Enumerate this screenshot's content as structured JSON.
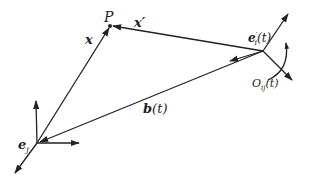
{
  "figure": {
    "type": "coordinate-frame-diagram",
    "background": "#ffffff",
    "stroke_color": "#222222"
  },
  "labels": {
    "point_p": "P",
    "vector_x": "x",
    "vector_x_prime": "x′",
    "frame_j": "e",
    "frame_j_sub": "j",
    "frame_i": "e",
    "frame_i_sup": "′",
    "frame_i_sub": "i",
    "frame_i_arg": "(t)",
    "rotation": "O",
    "rotation_sub": "ij",
    "rotation_arg": "(t)",
    "translation": "b",
    "translation_arg": "(t)"
  },
  "geometry": {
    "origin_j": [
      37,
      143
    ],
    "origin_i": [
      263,
      51
    ],
    "point_p": [
      110,
      26
    ]
  }
}
